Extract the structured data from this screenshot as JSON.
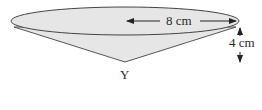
{
  "diagram": {
    "type": "cone",
    "labels": {
      "radius": "8 cm",
      "height": "4 cm",
      "apex": "Y"
    },
    "colors": {
      "fill": "#e6e6e6",
      "stroke": "#333333"
    }
  }
}
